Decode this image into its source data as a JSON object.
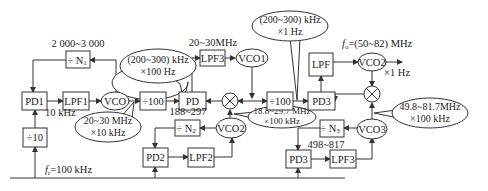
{
  "diagram": {
    "type": "block-diagram",
    "blocks": {
      "pd1": "PD1",
      "lpf1": "LPF1",
      "vco": "VCO",
      "div_n1": "÷ N",
      "div_n1_sub": "1",
      "div10": "÷10",
      "div100_a": "÷100",
      "pd": "PD",
      "lpf3_top": "LPF3",
      "vco1": "VCO1",
      "div100_b": "÷100",
      "pd3_top": "PD3",
      "lpf": "LPF",
      "vco2_top": "VCO2",
      "div_n2": "÷ N",
      "div_n2_sub": "2",
      "vco2_mid": "VCO2",
      "pd2": "PD2",
      "lpf2": "LPF2",
      "div_n3": "÷ N",
      "div_n3_sub": "3",
      "vco3": "VCO3",
      "pd3_bottom": "PD3",
      "lpf3_bottom": "LPF3",
      "mixer_1": "⊗",
      "mixer_2": "⊗"
    },
    "labels": {
      "n1_range": "2 000~3 000",
      "ten_khz": "10 kHz",
      "fr": "f",
      "fr_sub": "r",
      "fr_value": "=100 kHz",
      "lpf3_freq": "20~30MHz",
      "fo": "f",
      "fo_sub": "o",
      "fo_value": "=(50~82) MHz",
      "x1hz": "×1 Hz",
      "n2_range": "188~297",
      "n3_range": "498~817"
    },
    "callouts": {
      "c1_line1": "(200~300) kHz",
      "c1_line2": "×100 Hz",
      "c2_line1": "20~30 MHz",
      "c2_line2": "×10 kHz",
      "c3_line1": "(200~300) kHz",
      "c3_line2": "×1 Hz",
      "c4_line1": "18.8~29.7 MHz",
      "c4_line2": "×100 kHz",
      "c5_line1": "49.8~81.7MHz",
      "c5_line2": "×100 kHz"
    }
  }
}
